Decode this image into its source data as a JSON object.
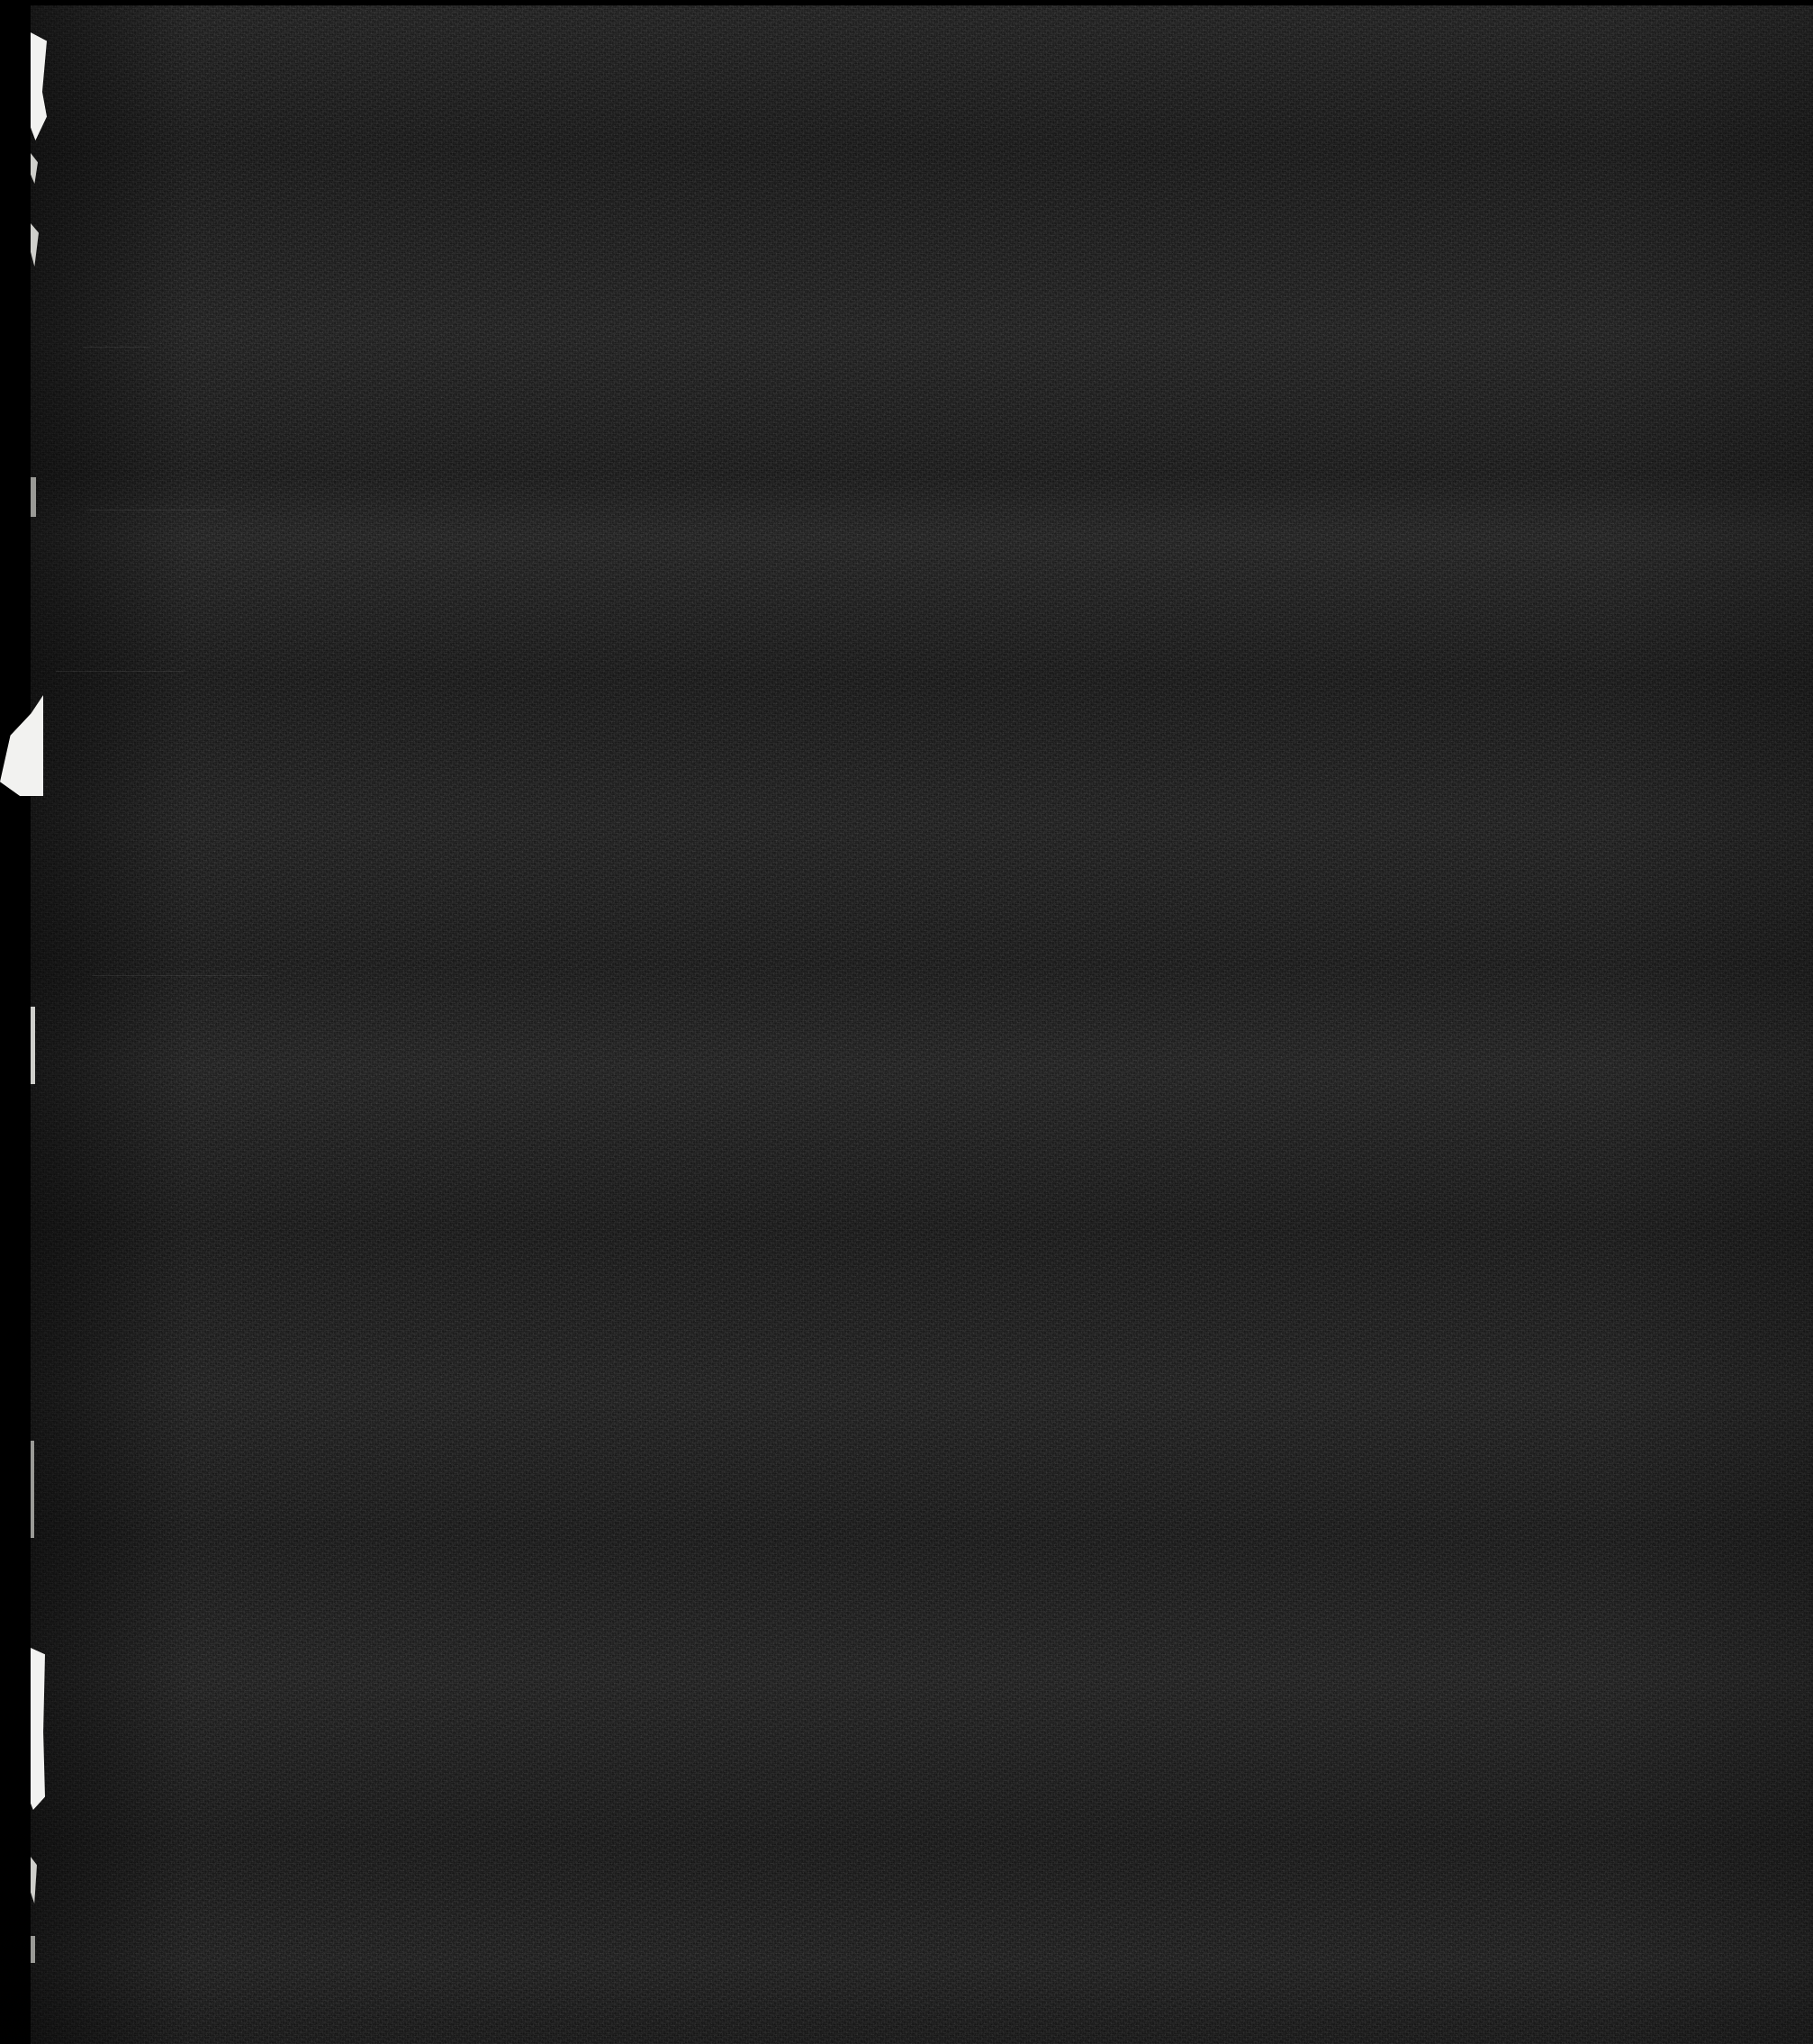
{
  "document": {
    "kind": "scanned-page",
    "title": "Scanned document page",
    "legibility": "illegible",
    "note": "Severely underexposed scan — no readable text is rendered in the pixels",
    "visible_text": ""
  },
  "canvas": {
    "width": 2014,
    "height": 2270,
    "background_color": "#000000"
  },
  "page": {
    "x": 34,
    "y": 6,
    "width": 1980,
    "height": 2264,
    "paper_color": "#1d1d1d",
    "grain": "heavy-scanner-noise"
  },
  "margins": {
    "left_margin_color": "#000000",
    "left_margin_width": 34,
    "top_margin_color": "#000000",
    "top_margin_height": 6
  },
  "artifacts": {
    "edge_tears": [
      {
        "name": "tear-upper-1",
        "x": 34,
        "y": 36,
        "width": 18,
        "height": 120,
        "tone": "bright"
      },
      {
        "name": "tear-upper-2",
        "x": 34,
        "y": 170,
        "width": 8,
        "height": 34,
        "tone": "soft"
      },
      {
        "name": "tear-mid-1",
        "x": 34,
        "y": 248,
        "width": 9,
        "height": 48,
        "tone": "soft"
      },
      {
        "name": "tear-mid-2",
        "x": 34,
        "y": 530,
        "width": 6,
        "height": 44,
        "tone": "dim"
      },
      {
        "name": "tear-wedge",
        "x": 0,
        "y": 770,
        "width": 46,
        "height": 110,
        "tone": "bright"
      },
      {
        "name": "tear-streak-1",
        "x": 34,
        "y": 1118,
        "width": 5,
        "height": 86,
        "tone": "soft"
      },
      {
        "name": "tear-streak-2",
        "x": 34,
        "y": 1600,
        "width": 4,
        "height": 108,
        "tone": "dim"
      },
      {
        "name": "tear-strip",
        "x": 34,
        "y": 1830,
        "width": 15,
        "height": 178,
        "tone": "bright"
      },
      {
        "name": "tear-lower-1",
        "x": 34,
        "y": 2060,
        "width": 7,
        "height": 52,
        "tone": "soft"
      },
      {
        "name": "tear-lower-2",
        "x": 34,
        "y": 2150,
        "width": 5,
        "height": 30,
        "tone": "dim"
      }
    ],
    "rules": [
      {
        "name": "rule-1",
        "x": 92,
        "y": 385,
        "width": 74
      },
      {
        "name": "rule-2",
        "x": 96,
        "y": 566,
        "width": 156
      },
      {
        "name": "rule-3",
        "x": 62,
        "y": 745,
        "width": 142
      },
      {
        "name": "rule-4",
        "x": 102,
        "y": 1083,
        "width": 196
      }
    ],
    "banding": "horizontal-scanner-banding"
  }
}
